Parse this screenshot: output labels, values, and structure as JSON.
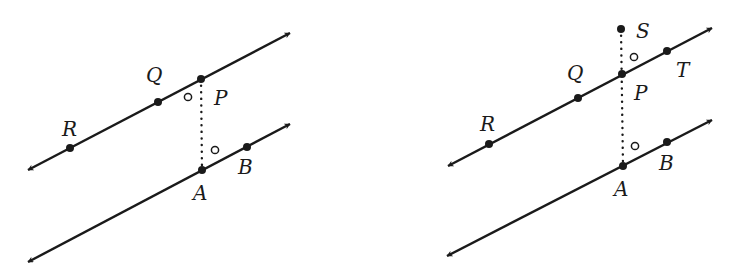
{
  "figures": [
    {
      "id": "left",
      "lines": [
        {
          "name": "line-RP",
          "from": [
            28,
            170
          ],
          "to": [
            290,
            33
          ],
          "arrows": "both"
        },
        {
          "name": "line-AB",
          "from": [
            28,
            262
          ],
          "to": [
            290,
            124
          ],
          "arrows": "both"
        }
      ],
      "segment": {
        "name": "PA",
        "from": [
          201,
          79
        ],
        "to": [
          202,
          170
        ],
        "style": "dotted"
      },
      "points": [
        {
          "label": "R",
          "x": 70,
          "y": 148,
          "lx": 62,
          "ly": 136
        },
        {
          "label": "Q",
          "x": 158,
          "y": 102,
          "lx": 146,
          "ly": 82
        },
        {
          "label": "P",
          "x": 201,
          "y": 79,
          "lx": 214,
          "ly": 105
        },
        {
          "label": "A",
          "x": 202,
          "y": 170,
          "lx": 193,
          "ly": 200
        },
        {
          "label": "B",
          "x": 247,
          "y": 147,
          "lx": 238,
          "ly": 174
        }
      ],
      "angle_marks": [
        {
          "x": 188,
          "y": 97
        },
        {
          "x": 215,
          "y": 150
        }
      ]
    },
    {
      "id": "right",
      "lines": [
        {
          "name": "line-RT",
          "from": [
            448,
            166
          ],
          "to": [
            712,
            28
          ],
          "arrows": "both"
        },
        {
          "name": "line-AB",
          "from": [
            447,
            256
          ],
          "to": [
            712,
            120
          ],
          "arrows": "both"
        }
      ],
      "segment": {
        "name": "SA",
        "from": [
          621,
          29
        ],
        "to": [
          623,
          166
        ],
        "style": "dotted"
      },
      "points": [
        {
          "label": "S",
          "x": 621,
          "y": 29,
          "lx": 636,
          "ly": 38
        },
        {
          "label": "R",
          "x": 489,
          "y": 144,
          "lx": 480,
          "ly": 131
        },
        {
          "label": "Q",
          "x": 578,
          "y": 98,
          "lx": 567,
          "ly": 80
        },
        {
          "label": "P",
          "x": 622,
          "y": 74,
          "lx": 634,
          "ly": 100
        },
        {
          "label": "T",
          "x": 667,
          "y": 51,
          "lx": 676,
          "ly": 77
        },
        {
          "label": "A",
          "x": 623,
          "y": 166,
          "lx": 614,
          "ly": 196
        },
        {
          "label": "B",
          "x": 667,
          "y": 142,
          "lx": 659,
          "ly": 170
        }
      ],
      "angle_marks": [
        {
          "x": 634,
          "y": 57
        },
        {
          "x": 635,
          "y": 146
        }
      ]
    }
  ]
}
